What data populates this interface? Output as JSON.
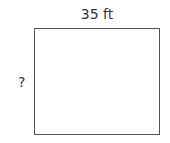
{
  "diagram": {
    "shape": "rectangle",
    "width_label": "35 ft",
    "height_label": "?",
    "stroke_color": "#555555"
  }
}
